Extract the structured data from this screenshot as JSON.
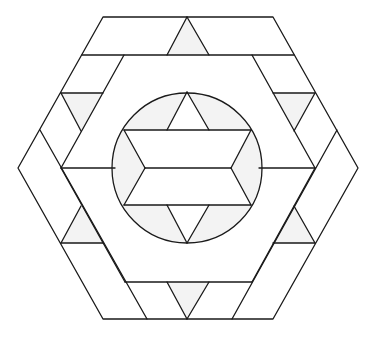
{
  "diagram": {
    "type": "geometric-pattern",
    "colors": {
      "stroke": "#1a1a1a",
      "shade": "#f3f3f3",
      "background": "#ffffff"
    },
    "outer_hexagon": [
      [
        103,
        17
      ],
      [
        273,
        17
      ],
      [
        358,
        168
      ],
      [
        273,
        319
      ],
      [
        103,
        319
      ],
      [
        18,
        168
      ]
    ],
    "circle": {
      "cx": 187,
      "cy": 168,
      "r": 75
    },
    "shaded_triangles": [
      [
        [
          187,
          17
        ],
        [
          167,
          55
        ],
        [
          209,
          55
        ]
      ],
      [
        [
          61,
          93
        ],
        [
          103,
          93
        ],
        [
          81,
          131
        ]
      ],
      [
        [
          273,
          93
        ],
        [
          315,
          93
        ],
        [
          294,
          131
        ]
      ],
      [
        [
          81,
          206
        ],
        [
          61,
          243
        ],
        [
          103,
          243
        ]
      ],
      [
        [
          294,
          206
        ],
        [
          273,
          243
        ],
        [
          315,
          243
        ]
      ],
      [
        [
          167,
          282
        ],
        [
          209,
          282
        ],
        [
          187,
          319
        ]
      ]
    ],
    "inner_star": {
      "top": [
        187,
        92
      ],
      "bottom": [
        187,
        243
      ],
      "upper_line_y": 130,
      "middle_line_y": 168,
      "lower_line_y": 205
    },
    "labels": []
  }
}
